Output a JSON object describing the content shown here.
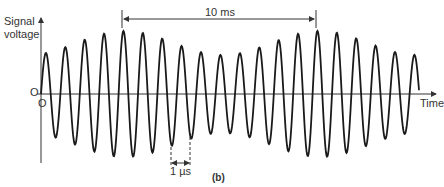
{
  "figure": {
    "caption": "(b)",
    "y_axis_label_line1": "Signal",
    "y_axis_label_line2": "voltage",
    "y_zero_label": "O",
    "x_zero_label": "O",
    "x_axis_label": "Time",
    "envelope_period_label": "10 ms",
    "carrier_period_label": "1 µs",
    "colors": {
      "line": "#1a1a1a",
      "axis": "#333333",
      "text": "#333333"
    }
  },
  "chart_data": {
    "type": "line",
    "xlabel": "Time",
    "ylabel": "Signal voltage",
    "annotations": [
      "10 ms (envelope period)",
      "1 µs (carrier period)"
    ],
    "carrier_cycles": 19.5,
    "envelope": {
      "mean_amplitude": 51,
      "modulation_amplitude": 12,
      "max_amplitude_px": 63,
      "min_amplitude_px": 39
    },
    "peak_envelope_values": [
      40,
      40,
      51,
      58,
      63,
      61,
      54,
      47,
      41,
      39,
      39,
      42,
      51,
      57,
      63,
      60,
      54,
      47,
      41,
      39
    ],
    "grid": false,
    "legend": "none"
  }
}
